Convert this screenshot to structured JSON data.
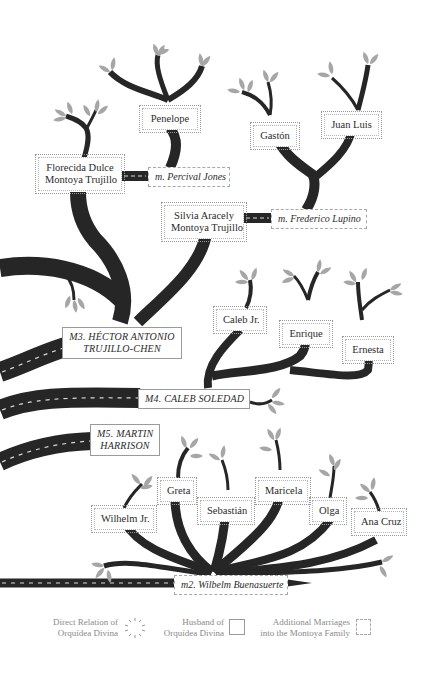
{
  "diagram": {
    "type": "family-tree",
    "colors": {
      "branch": "#262626",
      "leaf": "#a6a6a6",
      "road_dash": "#d8d8d8",
      "label_text": "#2b2b2b",
      "legend_text": "#8a8a8a"
    },
    "husbands": [
      {
        "id": "m2",
        "label": "m2. Wilbelm Buenasuerte"
      },
      {
        "id": "m3",
        "label_line1": "m3. HÉCTOR ANTONIO",
        "label_line2": "TRUJILLO-CHEN"
      },
      {
        "id": "m4",
        "label": "m4. CALEB SOLEDAD"
      },
      {
        "id": "m5",
        "label_line1": "m5. MARTIN",
        "label_line2": "HARRISON"
      }
    ],
    "additional_marriages": [
      {
        "label": "m. Percival Jones"
      },
      {
        "label": "m. Frederico Lupino"
      }
    ],
    "direct_relations": {
      "florecida": {
        "line1": "Florecida Dulce",
        "line2": "Montoya Trujillo"
      },
      "silvia": {
        "line1": "Silvia Aracely",
        "line2": "Montoya Trujillo"
      },
      "penelope": "Penelope",
      "gaston": "Gastón",
      "juan_luis": "Juan Luis",
      "caleb_jr": "Caleb Jr.",
      "enrique": "Enrique",
      "ernesta": "Ernesta",
      "wilhelm_jr": "Wilhelm Jr.",
      "greta": "Greta",
      "sebastian": "Sebastián",
      "maricela": "Maricela",
      "olga": "Olga",
      "ana_cruz": "Ana Cruz"
    },
    "legend": {
      "direct": {
        "line1": "Direct Relation of",
        "line2": "Orquídea Divina"
      },
      "husband": {
        "line1": "Husband of",
        "line2": "Orquídea Divina"
      },
      "additional": {
        "line1": "Additional Marriages",
        "line2": "into the Montoya Family"
      }
    }
  }
}
